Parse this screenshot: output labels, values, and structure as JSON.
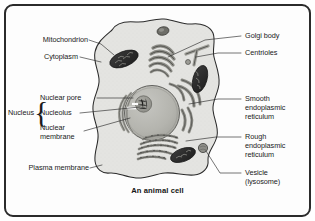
{
  "figure": {
    "caption": "An animal cell",
    "background_color": "#ffffff",
    "frame_color": "#2b2b2b",
    "cytoplasm_color": "#e2e2e0",
    "nucleus_color": "#b9b9b4",
    "nucleolus_color": "#9a9a94",
    "organelle_dark_color": "#2e2e2e",
    "line_color": "#2b2b2b"
  },
  "labels": {
    "left": [
      {
        "id": "mitochondrion",
        "text": "Mitochondrion"
      },
      {
        "id": "cytoplasm",
        "text": "Cytoplasm"
      },
      {
        "id": "nuclear-pore",
        "text": "Nuclear pore"
      },
      {
        "id": "nucleolus",
        "text": "Nucleolus"
      },
      {
        "id": "nuclear-membrane",
        "text": "Nuclear\nmembrane"
      },
      {
        "id": "nucleus",
        "text": "Nucleus"
      },
      {
        "id": "plasma-membrane",
        "text": "Plasma membrane"
      }
    ],
    "right": [
      {
        "id": "golgi-body",
        "text": "Golgi body"
      },
      {
        "id": "centrioles",
        "text": "Centrioles"
      },
      {
        "id": "smooth-er",
        "text": "Smooth\nendoplasmic\nreticulum"
      },
      {
        "id": "rough-er",
        "text": "Rough\nendoplasmic\nreticulum"
      },
      {
        "id": "vesicle",
        "text": "Vesicle\n(lysosome)"
      }
    ],
    "mitochondrion": "Mitochondrion",
    "cytoplasm": "Cytoplasm",
    "nuclear_pore": "Nuclear pore",
    "nucleolus": "Nucleolus",
    "nuclear_membrane_line1": "Nuclear",
    "nuclear_membrane_line2": "membrane",
    "nucleus": "Nucleus",
    "plasma_membrane": "Plasma membrane",
    "golgi_body": "Golgi body",
    "centrioles": "Centrioles",
    "smooth_er_line1": "Smooth",
    "smooth_er_line2": "endoplasmic",
    "smooth_er_line3": "reticulum",
    "rough_er_line1": "Rough",
    "rough_er_line2": "endoplasmic",
    "rough_er_line3": "reticulum",
    "vesicle_line1": "Vesicle",
    "vesicle_line2": "(lysosome)",
    "nucleus_brace": "{"
  },
  "diagram_parts": [
    {
      "name": "cell-membrane-outline",
      "description": "irregular rounded cell boundary"
    },
    {
      "name": "cytoplasm-fill",
      "description": "light grey interior fill"
    },
    {
      "name": "nucleus",
      "description": "large grey circle, centre-left"
    },
    {
      "name": "nucleolus",
      "description": "small darker circle inside nucleus"
    },
    {
      "name": "nuclear-membrane",
      "description": "double outline around nucleus"
    },
    {
      "name": "nuclear-pore",
      "description": "gap in nuclear envelope at left"
    },
    {
      "name": "golgi-body",
      "description": "stack of curved flattened sacs, upper centre"
    },
    {
      "name": "centrioles",
      "description": "two short rods at right, one with small circle"
    },
    {
      "name": "mitochondrion-upper-left",
      "description": "dark bean-shaped organelle with cristae"
    },
    {
      "name": "mitochondrion-right",
      "description": "dark bean-shaped organelle at right"
    },
    {
      "name": "mitochondrion-lower",
      "description": "dark bean-shaped organelle lower centre"
    },
    {
      "name": "smooth-endoplasmic-reticulum",
      "description": "smooth curved tubules right of nucleus"
    },
    {
      "name": "rough-endoplasmic-reticulum",
      "description": "beaded ribosome-studded sheets below nucleus"
    },
    {
      "name": "vesicle-top",
      "description": "small dark oval near top of cell"
    },
    {
      "name": "vesicle-lysosome",
      "description": "small round vesicle at lower right"
    }
  ]
}
